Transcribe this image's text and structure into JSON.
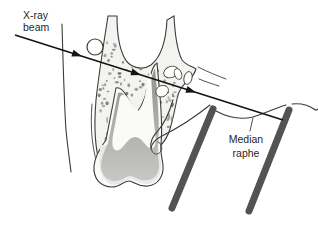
{
  "diagram": {
    "type": "anatomical-illustration",
    "labels": {
      "beam": {
        "line1": "X-ray",
        "line2": "beam"
      },
      "raphe": {
        "line1": "Median",
        "line2": "raphe"
      }
    },
    "colors": {
      "background": "#ffffff",
      "outline": "#3c3c3c",
      "beam": "#141414",
      "bone_fill": "#f3f3f0",
      "stipple": "#7d7d7d",
      "dentin_dark": "#8f8f8f",
      "dentin_light": "#c9c9c7",
      "enamel": "#e8e8e5",
      "pulp": "#fafaf8",
      "tooth_body": "#fbfbf9",
      "rod": "#535353",
      "label_text": "#1f1f1f"
    }
  }
}
